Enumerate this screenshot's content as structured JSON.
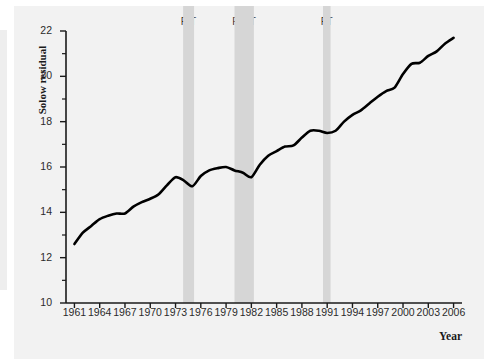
{
  "chart_data": {
    "type": "line",
    "title": "",
    "xlabel": "Year",
    "ylabel": "Solow residual",
    "xlim": [
      1960,
      2007
    ],
    "ylim": [
      10,
      22
    ],
    "grid": false,
    "legend": "none",
    "series": [
      {
        "name": "Solow residual",
        "color": "#000000",
        "x": [
          1961,
          1962,
          1963,
          1964,
          1965,
          1966,
          1967,
          1968,
          1969,
          1970,
          1971,
          1972,
          1973,
          1974,
          1975,
          1976,
          1977,
          1978,
          1979,
          1980,
          1981,
          1982,
          1983,
          1984,
          1985,
          1986,
          1987,
          1988,
          1989,
          1990,
          1991,
          1992,
          1993,
          1994,
          1995,
          1996,
          1997,
          1998,
          1999,
          2000,
          2001,
          2002,
          2003,
          2004,
          2005,
          2006
        ],
        "values": [
          12.6,
          13.1,
          13.4,
          13.7,
          13.85,
          13.95,
          13.95,
          14.25,
          14.45,
          14.6,
          14.8,
          15.2,
          15.55,
          15.4,
          15.15,
          15.6,
          15.85,
          15.95,
          16.0,
          15.85,
          15.75,
          15.55,
          16.1,
          16.5,
          16.7,
          16.9,
          16.95,
          17.3,
          17.6,
          17.6,
          17.5,
          17.6,
          18.0,
          18.3,
          18.5,
          18.8,
          19.1,
          19.35,
          19.5,
          20.1,
          20.55,
          20.6,
          20.9,
          21.1,
          21.45,
          21.7
        ]
      }
    ],
    "y_ticks": [
      10,
      12,
      14,
      16,
      18,
      20,
      22
    ],
    "y_minor_ticks": [
      11,
      13,
      15,
      17,
      19,
      21
    ],
    "x_ticks": [
      1961,
      1964,
      1967,
      1970,
      1973,
      1976,
      1979,
      1982,
      1985,
      1988,
      1991,
      1994,
      1997,
      2000,
      2003,
      2006
    ],
    "recession_bands": [
      {
        "peak_year": 1973.9,
        "trough_year": 1975.2,
        "peak_label": "P",
        "trough_label": "T",
        "color": "#d6d6d6"
      },
      {
        "peak_year": 1980.0,
        "trough_year": 1982.3,
        "peak_label": "P",
        "trough_label": "T",
        "color": "#d6d6d6"
      },
      {
        "peak_year": 1990.5,
        "trough_year": 1991.4,
        "peak_label": "P",
        "trough_label": "T",
        "color": "#d6d6d6"
      }
    ]
  },
  "axes": {
    "y_axis_title": "Solow residual",
    "x_axis_title": "Year",
    "y_tick_labels": [
      "22",
      "20",
      "18",
      "16",
      "14",
      "12",
      "10"
    ],
    "x_tick_labels": [
      "1961",
      "1964",
      "1967",
      "1970",
      "1973",
      "1976",
      "1979",
      "1982",
      "1985",
      "1988",
      "1991",
      "1994",
      "1997",
      "2000",
      "2003",
      "2006"
    ]
  },
  "band_labels": [
    {
      "p": "P",
      "t": "T"
    },
    {
      "p": "P",
      "t": "T"
    },
    {
      "p": "P",
      "t": "T"
    }
  ],
  "colors": {
    "line": "#000000",
    "band": "#d6d6d6",
    "axis": "#1a1a1a",
    "page_background": "#f2f2f2",
    "plot_background": "#ffffff"
  }
}
